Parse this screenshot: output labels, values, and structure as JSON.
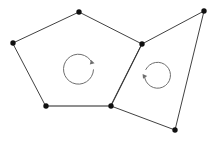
{
  "figure": {
    "canvas": {
      "width": 216,
      "height": 146,
      "background": "#ffffff"
    },
    "stroke_color": "#2b2b2b",
    "shared_edge_color": "#8a8a8a",
    "vertex_color": "#101010",
    "arrow_color": "#6e6e6e"
  },
  "shapes": [
    {
      "name": "pentagon",
      "label": "left-pentagon",
      "sides": 5,
      "points": "13,43 79,12 142,44 111,106 46,106",
      "vertices": [
        {
          "name": "pentagon-vertex-left",
          "x": 13,
          "y": 43
        },
        {
          "name": "pentagon-vertex-top",
          "x": 79,
          "y": 12
        },
        {
          "name": "pentagon-vertex-right",
          "x": 142,
          "y": 44
        },
        {
          "name": "pentagon-vertex-bottom-right",
          "x": 111,
          "y": 106
        },
        {
          "name": "pentagon-vertex-bottom-left",
          "x": 46,
          "y": 106
        }
      ]
    },
    {
      "name": "quadrilateral",
      "label": "right-quadrilateral",
      "sides": 4,
      "points": "142,44 204,11 175,130 111,106",
      "vertices": [
        {
          "name": "quad-vertex-top-left",
          "x": 142,
          "y": 44
        },
        {
          "name": "quad-vertex-top-right",
          "x": 204,
          "y": 11
        },
        {
          "name": "quad-vertex-bottom-right",
          "x": 175,
          "y": 130
        },
        {
          "name": "quad-vertex-bottom-left",
          "x": 111,
          "y": 106
        }
      ]
    }
  ],
  "shared_edge": {
    "name": "bottom-edge-highlight",
    "from": {
      "x": 46,
      "y": 106
    },
    "to": {
      "x": 111,
      "y": 106
    }
  },
  "rotation_arrows": [
    {
      "name": "left-rotation-arrow",
      "direction": "counterclockwise",
      "center": {
        "x": 79,
        "y": 67
      },
      "radius": 15
    },
    {
      "name": "right-rotation-arrow",
      "direction": "clockwise",
      "center": {
        "x": 156,
        "y": 73
      },
      "radius": 13
    }
  ]
}
